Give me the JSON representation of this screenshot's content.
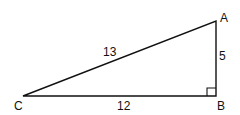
{
  "diagram": {
    "type": "right-triangle",
    "vertices": {
      "A": {
        "label": "A",
        "x": 216,
        "y": 21
      },
      "B": {
        "label": "B",
        "x": 216,
        "y": 96
      },
      "C": {
        "label": "C",
        "x": 23,
        "y": 96
      }
    },
    "sides": {
      "hypotenuse_CA": {
        "label": "13"
      },
      "leg_CB": {
        "label": "12"
      },
      "leg_BA": {
        "label": "5"
      }
    },
    "right_angle_at": "B",
    "colors": {
      "stroke": "#111111",
      "background": "#ffffff"
    }
  }
}
